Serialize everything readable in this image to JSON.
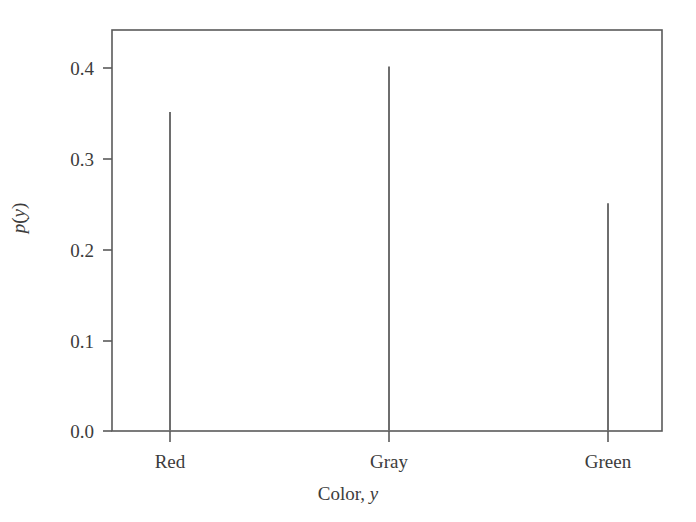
{
  "chart_data": {
    "type": "bar",
    "title": "",
    "subtitle": "",
    "categories": [
      "Red",
      "Gray",
      "Green"
    ],
    "values": [
      0.35,
      0.4,
      0.25
    ],
    "series": [
      {
        "name": "p(y)",
        "values": [
          0.35,
          0.4,
          0.25
        ]
      }
    ],
    "xlabel": "Color, y",
    "xlabel_text": "Color,",
    "xlabel_italic": "y",
    "ylabel": "p(y)",
    "ylabel_italic_p": "p",
    "ylabel_paren_open": "(",
    "ylabel_italic_y": "y",
    "ylabel_paren_close": ")",
    "ylim": [
      0.0,
      0.44
    ],
    "xlim": [
      0,
      4
    ],
    "yticks": [
      0.0,
      0.1,
      0.2,
      0.3,
      0.4
    ],
    "ytick_labels": [
      "0.0",
      "0.1",
      "0.2",
      "0.3",
      "0.4"
    ],
    "xtick_labels": [
      "Red",
      "Gray",
      "Green"
    ],
    "grid": false,
    "legend": false,
    "legend_position": "none",
    "bar_style": "stem",
    "annotations": []
  },
  "style": {
    "background_color": "#ffffff",
    "axis_color": "#5a5a5a",
    "text_color": "#3c3c3c",
    "bar_color": "#6e6e6e"
  },
  "geometry": {
    "plot_left": 112,
    "plot_right": 662,
    "plot_top": 30,
    "plot_bottom": 431,
    "tick_x": [
      170,
      389,
      608
    ],
    "tick_y": [
      431,
      341,
      250,
      159,
      68
    ],
    "bar_top_y": [
      118,
      66,
      198
    ]
  }
}
